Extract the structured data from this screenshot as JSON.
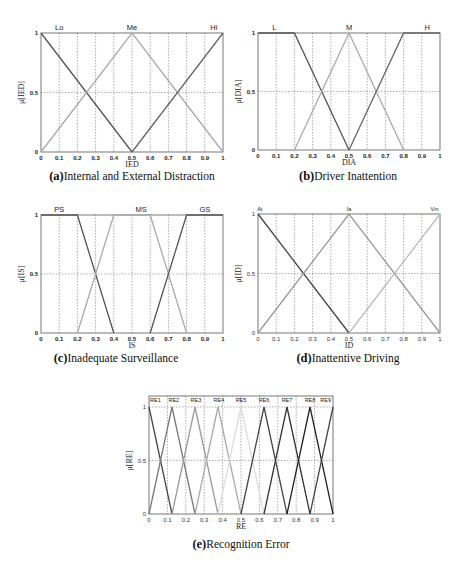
{
  "chart_data": [
    {
      "id": "a",
      "type": "line",
      "title": "Internal and External Distraction",
      "caption_letter": "(a)",
      "xlabel": "IED",
      "ylabel": "μ[IED]",
      "xlim": [
        0,
        1
      ],
      "ylim": [
        0,
        1
      ],
      "xticks": [
        "0",
        "0.1",
        "0.2",
        "0.3",
        "0.4",
        "0.5",
        "0.6",
        "0.7",
        "0.8",
        "0.9",
        "1"
      ],
      "yticks": [
        "0",
        "0.5",
        "1"
      ],
      "grid": true,
      "bold_ticks": true,
      "label_size": "normal",
      "series": [
        {
          "name": "Lo",
          "points": [
            [
              0,
              1
            ],
            [
              0.5,
              0
            ]
          ],
          "color": "#555555",
          "label_x": 0.1
        },
        {
          "name": "Me",
          "points": [
            [
              0,
              0
            ],
            [
              0.5,
              1
            ],
            [
              1,
              0
            ]
          ],
          "color": "#aaaaaa",
          "label_x": 0.5
        },
        {
          "name": "Hi",
          "points": [
            [
              0.5,
              0
            ],
            [
              1,
              1
            ]
          ],
          "color": "#666666",
          "label_x": 0.95
        }
      ]
    },
    {
      "id": "b",
      "type": "line",
      "title": "Driver Inattention",
      "caption_letter": "(b)",
      "xlabel": "DIA",
      "ylabel": "μ[DIA]",
      "xlim": [
        0,
        1
      ],
      "ylim": [
        0,
        1
      ],
      "xticks": [
        "0",
        "0.1",
        "0.2",
        "0.3",
        "0.4",
        "0.5",
        "0.6",
        "0.7",
        "0.8",
        "0.9",
        "1"
      ],
      "yticks": [
        "0",
        "0.5",
        "1"
      ],
      "grid": true,
      "bold_ticks": true,
      "label_size": "normal",
      "series": [
        {
          "name": "L",
          "points": [
            [
              0,
              1
            ],
            [
              0.2,
              1
            ],
            [
              0.5,
              0
            ]
          ],
          "color": "#555555",
          "label_x": 0.09
        },
        {
          "name": "M",
          "points": [
            [
              0.2,
              0
            ],
            [
              0.5,
              1
            ],
            [
              0.8,
              0
            ]
          ],
          "color": "#aaaaaa",
          "label_x": 0.5
        },
        {
          "name": "H",
          "points": [
            [
              0.5,
              0
            ],
            [
              0.8,
              1
            ],
            [
              1,
              1
            ]
          ],
          "color": "#666666",
          "label_x": 0.93
        }
      ]
    },
    {
      "id": "c",
      "type": "line",
      "title": "Inadequate Surveillance",
      "caption_letter": "(c)",
      "xlabel": "IS",
      "ylabel": "μ[IS]",
      "xlim": [
        0,
        1
      ],
      "ylim": [
        0,
        1
      ],
      "xticks": [
        "0",
        "0.1",
        "0.2",
        "0.3",
        "0.4",
        "0.5",
        "0.6",
        "0.7",
        "0.8",
        "0.9",
        "1"
      ],
      "yticks": [
        "0",
        "0.5",
        "1"
      ],
      "grid": true,
      "bold_ticks": true,
      "label_size": "normal",
      "series": [
        {
          "name": "PS",
          "points": [
            [
              0,
              1
            ],
            [
              0.2,
              1
            ],
            [
              0.4,
              0
            ]
          ],
          "color": "#555555",
          "label_x": 0.1
        },
        {
          "name": "MS",
          "points": [
            [
              0.2,
              0
            ],
            [
              0.4,
              1
            ],
            [
              0.6,
              1
            ],
            [
              0.8,
              0
            ]
          ],
          "color": "#aaaaaa",
          "label_x": 0.55
        },
        {
          "name": "GS",
          "points": [
            [
              0.6,
              0
            ],
            [
              0.8,
              1
            ],
            [
              1,
              1
            ]
          ],
          "color": "#555555",
          "label_x": 0.9
        }
      ]
    },
    {
      "id": "d",
      "type": "line",
      "title": "Inattentive Driving",
      "caption_letter": "(d)",
      "xlabel": "ID",
      "ylabel": "μ[ID]",
      "xlim": [
        0,
        1
      ],
      "ylim": [
        0,
        1
      ],
      "xticks": [
        "0",
        "0.1",
        "0.2",
        "0.3",
        "0.4",
        "0.5",
        "0.6",
        "0.7",
        "0.8",
        "0.9",
        "1"
      ],
      "yticks": [
        "0",
        "0.5",
        "1"
      ],
      "grid": true,
      "bold_ticks": false,
      "label_size": "small",
      "series": [
        {
          "name": "At",
          "points": [
            [
              0,
              1
            ],
            [
              0.5,
              0
            ]
          ],
          "color": "#444444",
          "label_x": 0.01
        },
        {
          "name": "Ia",
          "points": [
            [
              0,
              0
            ],
            [
              0.5,
              1
            ],
            [
              1,
              0
            ]
          ],
          "color": "#999999",
          "label_x": 0.5
        },
        {
          "name": "Vin",
          "points": [
            [
              0.5,
              0
            ],
            [
              1,
              1
            ]
          ],
          "color": "#bbbbbb",
          "label_x": 0.97
        }
      ]
    },
    {
      "id": "e",
      "type": "line",
      "title": "Recognition Error",
      "caption_letter": "(e)",
      "xlabel": "RE",
      "ylabel": "μ[RE]",
      "xlim": [
        0,
        1
      ],
      "ylim": [
        0,
        1
      ],
      "xticks": [
        "0",
        "0.1",
        "0.2",
        "0.3",
        "0.4",
        "0.5",
        "0.6",
        "0.7",
        "0.8",
        "0.9",
        "1"
      ],
      "yticks": [
        "0",
        "0.5",
        "1"
      ],
      "grid": true,
      "bold_ticks": false,
      "label_size": "small",
      "series": [
        {
          "name": "RE1",
          "points": [
            [
              0,
              1
            ],
            [
              0.125,
              0
            ]
          ],
          "color": "#444444",
          "label_x": 0.035
        },
        {
          "name": "RE2",
          "points": [
            [
              0,
              0
            ],
            [
              0.125,
              1
            ],
            [
              0.25,
              0
            ]
          ],
          "color": "#777777",
          "label_x": 0.135
        },
        {
          "name": "RE3",
          "points": [
            [
              0.125,
              0
            ],
            [
              0.25,
              1
            ],
            [
              0.375,
              0
            ]
          ],
          "color": "#999999",
          "label_x": 0.255
        },
        {
          "name": "RE4",
          "points": [
            [
              0.25,
              0
            ],
            [
              0.375,
              1
            ],
            [
              0.5,
              0
            ]
          ],
          "color": "#aaaaaa",
          "label_x": 0.38
        },
        {
          "name": "RE5",
          "points": [
            [
              0.375,
              0
            ],
            [
              0.5,
              1
            ],
            [
              0.625,
              0
            ]
          ],
          "color": "#dddddd",
          "label_x": 0.5
        },
        {
          "name": "RE6",
          "points": [
            [
              0.5,
              0
            ],
            [
              0.625,
              1
            ],
            [
              0.75,
              0
            ]
          ],
          "color": "#444444",
          "label_x": 0.625
        },
        {
          "name": "RE7",
          "points": [
            [
              0.625,
              0
            ],
            [
              0.75,
              1
            ],
            [
              0.875,
              0
            ]
          ],
          "color": "#333333",
          "label_x": 0.75
        },
        {
          "name": "RE8",
          "points": [
            [
              0.75,
              0
            ],
            [
              0.875,
              1
            ],
            [
              1,
              0
            ]
          ],
          "color": "#222222",
          "label_x": 0.875
        },
        {
          "name": "RE9",
          "points": [
            [
              0.875,
              0
            ],
            [
              1,
              1
            ]
          ],
          "color": "#444444",
          "label_x": 0.96
        }
      ]
    }
  ],
  "captions": [
    {
      "letter": "(a)",
      "text": "Internal and External Distraction"
    },
    {
      "letter": "(b)",
      "text": "Driver Inattention"
    },
    {
      "letter": "(c)",
      "text": "Inadequate Surveillance"
    },
    {
      "letter": "(d)",
      "text": "Inattentive Driving"
    },
    {
      "letter": "(e)",
      "text": "Recognition Error"
    }
  ]
}
